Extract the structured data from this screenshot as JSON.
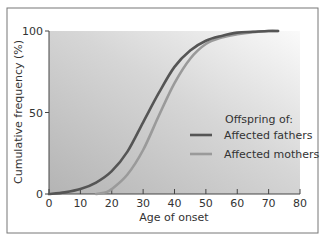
{
  "chart_data": {
    "type": "line",
    "title": "",
    "xlabel": "Age of onset",
    "ylabel": "Cumulative frequency (%)",
    "xlim": [
      0,
      80
    ],
    "ylim": [
      0,
      100
    ],
    "x_ticks": [
      0,
      10,
      20,
      30,
      40,
      50,
      60,
      70,
      80
    ],
    "y_ticks": [
      0,
      50,
      100
    ],
    "grid": false,
    "legend": {
      "title": "Offspring of:",
      "position": "lower right inside plot",
      "entries": [
        "Affected fathers",
        "Affected mothers"
      ]
    },
    "series": [
      {
        "name": "Affected fathers",
        "color": "#555555",
        "x": [
          0,
          5,
          10,
          15,
          20,
          25,
          30,
          35,
          40,
          45,
          50,
          55,
          60,
          65,
          70,
          73
        ],
        "y": [
          0,
          1,
          3,
          7,
          14,
          26,
          44,
          62,
          78,
          88,
          94,
          97,
          99,
          99.5,
          100,
          100
        ]
      },
      {
        "name": "Affected mothers",
        "color": "#9a9a9a",
        "x": [
          15,
          18,
          20,
          25,
          30,
          35,
          40,
          45,
          50,
          55,
          60,
          65,
          70,
          73
        ],
        "y": [
          0,
          1,
          3,
          12,
          27,
          48,
          68,
          83,
          92,
          96,
          98,
          99.3,
          100,
          100
        ]
      }
    ]
  }
}
